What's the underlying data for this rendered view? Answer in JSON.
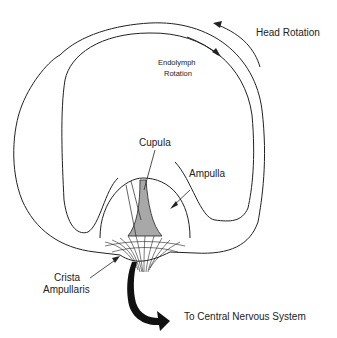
{
  "diagram": {
    "labels": {
      "head_rotation": "Head Rotation",
      "endolymph_line1": "Endolymph",
      "endolymph_line2": "Rotation",
      "cupula": "Cupula",
      "ampulla": "Ampulla",
      "crista_line1": "Crista",
      "crista_line2": "Ampullaris",
      "cns": "To Central Nervous System"
    },
    "colors": {
      "line": "#222222",
      "cupula_fill": "#a8a8a8",
      "nerve_arrow": "#111111"
    }
  }
}
